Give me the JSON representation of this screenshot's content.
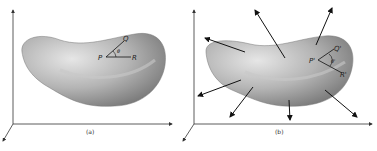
{
  "figure": {
    "panels": [
      {
        "caption": "(a)",
        "points": {
          "p": "P",
          "q": "Q",
          "r": "R"
        },
        "angle": "θ"
      },
      {
        "caption": "(b)",
        "points": {
          "p": "P'",
          "q": "Q'",
          "r": "R'"
        },
        "angle": "θ'"
      }
    ],
    "colors": {
      "axis": "#333333",
      "surface_light": "#d8d8d8",
      "surface_mid": "#a8a8a8",
      "surface_dark": "#6a6a6a",
      "arrow": "#111111"
    }
  }
}
